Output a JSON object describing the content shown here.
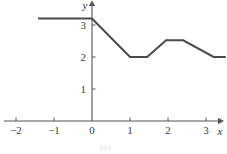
{
  "figure": {
    "width": 227,
    "height": 154,
    "background": "#ffffff",
    "caption_fragment": "(b)"
  },
  "chart_data": {
    "type": "line",
    "title": "",
    "subtitle": "",
    "xlabel": "x",
    "ylabel": "y",
    "xlim": [
      -2.45,
      3.55
    ],
    "ylim": [
      -0.25,
      3.7
    ],
    "xticks": [
      -2,
      -1,
      0,
      1,
      2,
      3
    ],
    "xtick_labels": [
      "−2",
      "−1",
      "0",
      "1",
      "2",
      "3"
    ],
    "yticks": [
      1,
      2,
      3
    ],
    "ytick_labels": [
      "1",
      "2",
      "3"
    ],
    "grid": false,
    "legend": null,
    "annotations": [],
    "axis_style": {
      "arrow_x": true,
      "arrow_y": true,
      "color": "#555555"
    },
    "series": [
      {
        "name": "piecewise-linear-curve",
        "color": "#4a4a4a",
        "linewidth": 2,
        "points": [
          [
            -1.42,
            3.2
          ],
          [
            0.0,
            3.2
          ],
          [
            1.0,
            2.0
          ],
          [
            1.45,
            2.0
          ],
          [
            1.95,
            2.52
          ],
          [
            2.4,
            2.52
          ],
          [
            3.2,
            2.0
          ],
          [
            3.52,
            2.0
          ]
        ]
      }
    ]
  }
}
